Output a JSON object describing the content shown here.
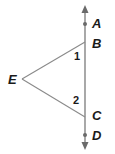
{
  "diagram": {
    "type": "geometry",
    "line": {
      "name": "line AD",
      "color": "#7a7a7a",
      "arrows": "both"
    },
    "triangle_segments": [
      {
        "from": "E",
        "to": "B"
      },
      {
        "from": "E",
        "to": "C"
      }
    ],
    "points": {
      "A": {
        "label": "A",
        "dot": true
      },
      "B": {
        "label": "B",
        "dot": false
      },
      "C": {
        "label": "C",
        "dot": false
      },
      "D": {
        "label": "D",
        "dot": true
      },
      "E": {
        "label": "E",
        "dot": false
      }
    },
    "angles": [
      {
        "label": "1",
        "vertex": "B"
      },
      {
        "label": "2",
        "vertex": "C"
      }
    ],
    "colors": {
      "line": "#7a7a7a",
      "segment": "#8a8a8a",
      "text": "#1a1a1a"
    }
  }
}
